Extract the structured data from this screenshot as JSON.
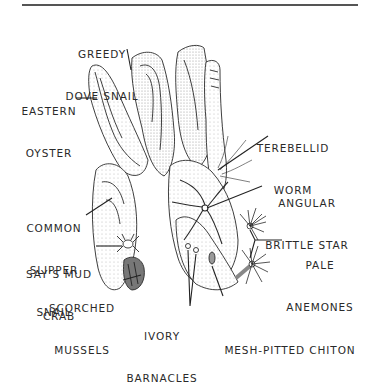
{
  "figure": {
    "type": "labeled-illustration",
    "colors": {
      "ink": "#2a2a2a",
      "rule": "#555555",
      "background": "#ffffff",
      "shade": "#bdbdbd"
    }
  },
  "labels": {
    "greedy_dove_snail": {
      "line1": "GREEDY",
      "line2": "DOVE SNAIL"
    },
    "eastern_oyster": {
      "line1": "EASTERN",
      "line2": "OYSTER"
    },
    "terebellid_worm": {
      "line1": "TEREBELLID",
      "line2": "WORM"
    },
    "angular_brittle_star": {
      "line1": "ANGULAR",
      "line2": "BRITTLE STAR"
    },
    "common_slipper_snail": {
      "line1": "COMMON",
      "line2": "SLIPPER",
      "line3": "SNAIL"
    },
    "says_mud_crab": {
      "line1": "SAY’S MUD",
      "line2": "CRAB"
    },
    "pale_anemones": {
      "line1": "PALE",
      "line2": "ANEMONES"
    },
    "scorched_mussels": {
      "line1": "SCORCHED",
      "line2": "MUSSELS"
    },
    "ivory_barnacles": {
      "line1": "IVORY",
      "line2": "BARNACLES"
    },
    "mesh_pitted_chiton": {
      "line1": "MESH-PITTED CHITON"
    }
  }
}
